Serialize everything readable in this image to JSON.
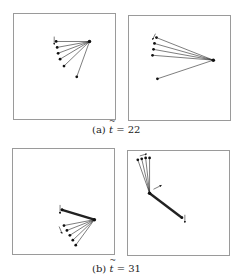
{
  "figure": {
    "subfigures": [
      {
        "id": "a",
        "label": "(a)",
        "var": "t",
        "eq": "= 22",
        "panels": [
          {
            "name": "a-left",
            "box": [
              13,
              13,
              103,
              107
            ],
            "hub": [
              77,
              28
            ],
            "tips": [
              [
                43,
                28
              ],
              [
                44,
                34
              ],
              [
                45,
                40
              ],
              [
                47,
                46
              ],
              [
                51,
                53
              ],
              [
                64,
                64
              ]
            ],
            "thick": [],
            "arrows": [
              {
                "from": [
                  41,
                  23
                ],
                "to": [
                  41,
                  31
                ]
              }
            ]
          },
          {
            "name": "a-right",
            "box": [
              128,
              15,
              103,
              106
            ],
            "hub": [
              86,
              45
            ],
            "tips": [
              [
                28,
                22
              ],
              [
                26,
                28
              ],
              [
                25,
                34
              ],
              [
                24,
                40
              ],
              [
                29,
                64
              ]
            ],
            "thick": [],
            "arrows": [
              {
                "from": [
                  27,
                  18
                ],
                "to": [
                  24,
                  24
                ]
              }
            ]
          }
        ]
      },
      {
        "id": "b",
        "label": "(b)",
        "var": "t",
        "eq": "= 31",
        "panels": [
          {
            "name": "b-left",
            "box": [
              12,
              148,
              103,
              107
            ],
            "hub": [
              83,
              72
            ],
            "tips": [
              [
                50,
                62
              ]
            ],
            "thick": [
              [
                50,
                62
              ]
            ],
            "fan": [
              [
                52,
                78
              ],
              [
                55,
                83
              ],
              [
                58,
                88
              ],
              [
                61,
                93
              ],
              [
                64,
                98
              ]
            ],
            "arrows": [
              {
                "from": [
                  48,
                  57
                ],
                "to": [
                  48,
                  66
                ]
              },
              {
                "from": [
                  47,
                  79
                ],
                "to": [
                  50,
                  86
                ]
              }
            ]
          },
          {
            "name": "b-right",
            "box": [
              127,
              150,
              103,
              106
            ],
            "hub": [
              22,
              43
            ],
            "tips": [
              [
                10,
                9
              ],
              [
                14,
                8
              ],
              [
                18,
                7
              ],
              [
                22,
                7
              ]
            ],
            "thick": [
              [
                55,
                68
              ]
            ],
            "arrows": [
              {
                "from": [
                  12,
                  5
                ],
                "to": [
                  19,
                  3
                ]
              },
              {
                "from": [
                  26,
                  39
                ],
                "to": [
                  34,
                  35
                ]
              },
              {
                "from": [
                  58,
                  65
                ],
                "to": [
                  58,
                  73
                ]
              }
            ]
          }
        ]
      }
    ]
  }
}
